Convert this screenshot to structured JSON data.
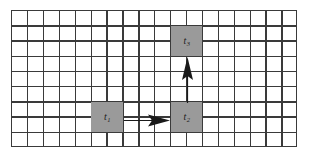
{
  "figure": {
    "type": "grid-diagram",
    "background_color": "#ffffff",
    "grid": {
      "columns": 18,
      "rows": 9,
      "line_color": "#3a3a3a",
      "cell_fill": "#ffffff",
      "border": true
    },
    "shaded_color": "#9a9a9a",
    "regions": [
      {
        "id": "t3",
        "label_base": "t",
        "label_sub": "3",
        "grid_col": 10,
        "grid_row": 1,
        "width_cells": 2,
        "height_cells": 2
      },
      {
        "id": "t1",
        "label_base": "t",
        "label_sub": "1",
        "grid_col": 5,
        "grid_row": 6,
        "width_cells": 2,
        "height_cells": 2
      },
      {
        "id": "t2",
        "label_base": "t",
        "label_sub": "2",
        "grid_col": 10,
        "grid_row": 6,
        "width_cells": 2,
        "height_cells": 2
      }
    ],
    "arrows": [
      {
        "id": "arrow-t1-to-t2",
        "direction": "right",
        "from_region": "t1",
        "to_region": "t2",
        "color": "#1a1a1a"
      },
      {
        "id": "arrow-t2-to-t3",
        "direction": "up",
        "from_region": "t2",
        "to_region": "t3",
        "color": "#1a1a1a"
      }
    ]
  }
}
